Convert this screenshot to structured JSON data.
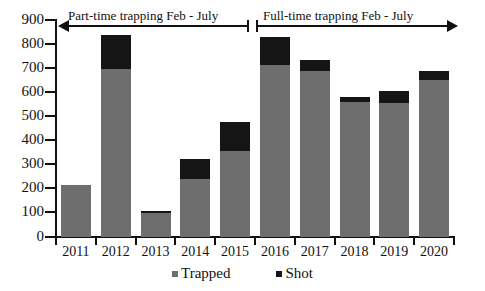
{
  "chart_data": {
    "type": "bar",
    "title": "",
    "xlabel": "",
    "ylabel": "",
    "ylim": [
      0,
      900
    ],
    "ytick_step": 100,
    "grid": false,
    "stacked": true,
    "legend_position": "bottom",
    "categories": [
      "2011",
      "2012",
      "2013",
      "2014",
      "2015",
      "2016",
      "2017",
      "2018",
      "2019",
      "2020"
    ],
    "series": [
      {
        "name": "Trapped",
        "color": "#6e6e6e",
        "values": [
          215,
          695,
          100,
          240,
          355,
          715,
          690,
          560,
          555,
          650
        ]
      },
      {
        "name": "Shot",
        "color": "#151515",
        "values": [
          0,
          143,
          8,
          82,
          123,
          115,
          45,
          20,
          50,
          40
        ]
      }
    ],
    "totals": [
      215,
      838,
      108,
      322,
      478,
      830,
      735,
      580,
      605,
      690
    ],
    "ytick_labels": [
      "900",
      "800",
      "700",
      "600",
      "500",
      "400",
      "300",
      "200",
      "100",
      "0"
    ],
    "annotations": [
      {
        "text": "Part-time trapping Feb - July",
        "range": [
          "2011",
          "2015"
        ],
        "arrow": "left"
      },
      {
        "text": "Full-time trapping Feb - July",
        "range": [
          "2016",
          "2020"
        ],
        "arrow": "right"
      }
    ]
  },
  "legend": {
    "items": [
      {
        "label": "Trapped",
        "color": "#6e6e6e"
      },
      {
        "label": "Shot",
        "color": "#151515"
      }
    ]
  }
}
